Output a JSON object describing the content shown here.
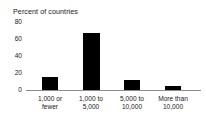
{
  "chart_data": {
    "type": "bar",
    "title": "Percent of countries",
    "xlabel": "",
    "ylabel": "",
    "ylim": [
      0,
      80
    ],
    "yticks": [
      0,
      20,
      40,
      60,
      80
    ],
    "ytick_labels": [
      "0",
      "20",
      "40",
      "60",
      "80"
    ],
    "grid": false,
    "legend": "none",
    "categories": [
      "1,000 or fewer",
      "1,000 to 5,000",
      "5,000 to 10,000",
      "More than 10,000"
    ],
    "category_lines": [
      [
        "1,000 or",
        "fewer"
      ],
      [
        "1,000 to",
        "5,000"
      ],
      [
        "5,000 to",
        "10,000"
      ],
      [
        "More than",
        "10,000"
      ]
    ],
    "values": [
      15,
      67,
      12,
      5
    ],
    "bar_color": "#000000",
    "axis_color": "#8c8c8c",
    "background_color": "#ffffff"
  }
}
